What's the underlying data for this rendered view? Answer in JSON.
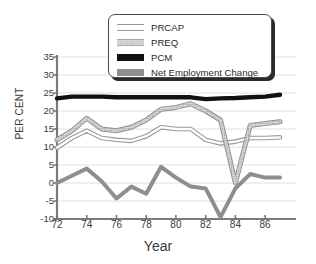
{
  "chart_data": {
    "type": "line",
    "title": "",
    "xlabel": "Year",
    "ylabel": "PER CENT",
    "x": [
      72,
      73,
      74,
      75,
      76,
      77,
      78,
      79,
      80,
      81,
      82,
      83,
      84,
      85,
      86,
      87
    ],
    "xtick_labels": [
      "72",
      "74",
      "76",
      "78",
      "80",
      "82",
      "84",
      "86"
    ],
    "xtick_values": [
      72,
      74,
      76,
      78,
      80,
      82,
      84,
      86
    ],
    "xlim": [
      72,
      87
    ],
    "ytick_labels": [
      "35",
      "30",
      "25",
      "20",
      "15",
      "10",
      "5",
      "0",
      "-5",
      "-10"
    ],
    "ytick_values": [
      35,
      30,
      25,
      20,
      15,
      10,
      5,
      0,
      -5,
      -10
    ],
    "ylim": [
      -10,
      35
    ],
    "grid": "horizontal",
    "legend_position": "top-center",
    "series": [
      {
        "name": "PRCAP",
        "color": "#ffffff",
        "edge_color": "#9a9a9a",
        "style": "outlined-band",
        "values": [
          9.8,
          12.5,
          14.5,
          12.5,
          12.0,
          11.7,
          13.0,
          15.5,
          15.0,
          15.0,
          12.0,
          11.0,
          11.5,
          12.5,
          12.5,
          12.7
        ]
      },
      {
        "name": "PREQ",
        "color": "#c4c4c4",
        "edge_color": "#8f8f8f",
        "style": "textured-band",
        "values": [
          12.0,
          14.5,
          18.0,
          15.0,
          14.5,
          15.5,
          17.5,
          20.5,
          21.0,
          22.0,
          20.0,
          17.5,
          0.0,
          16.0,
          16.5,
          17.0
        ]
      },
      {
        "name": "PCM",
        "color": "#111111",
        "edge_color": "#111111",
        "style": "solid-thick",
        "values": [
          23.5,
          24.0,
          24.0,
          24.0,
          23.8,
          23.8,
          23.8,
          23.8,
          23.8,
          23.8,
          23.3,
          23.5,
          23.6,
          23.8,
          24.0,
          24.5
        ]
      },
      {
        "name": "Net Employment Change",
        "color": "#8e8e8e",
        "edge_color": "#6d6d6d",
        "style": "solid-thick",
        "values": [
          0.0,
          2.0,
          4.0,
          0.5,
          -4.3,
          -1.0,
          -3.0,
          4.5,
          1.5,
          -1.0,
          -1.5,
          -9.5,
          -1.5,
          2.5,
          1.5,
          1.5
        ]
      }
    ]
  },
  "legend": {
    "items": [
      {
        "label": "PRCAP",
        "swatch": "prcap-swatch"
      },
      {
        "label": "PREQ",
        "swatch": "preq-swatch"
      },
      {
        "label": "PCM",
        "swatch": "pcm-swatch"
      },
      {
        "label": "Net Employment Change",
        "swatch": "nec-swatch"
      }
    ]
  }
}
